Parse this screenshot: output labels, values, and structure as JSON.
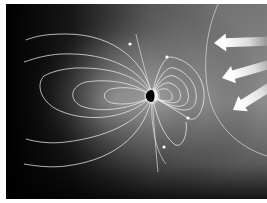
{
  "figure": {
    "title": "Earth's magnetosphere in the solar wind",
    "colors": {
      "background_dark": "#000000",
      "background_light": "#8a8a8a",
      "field_line": "#e6e6e6",
      "earth_day": "#f4f4f4",
      "earth_night": "#000000",
      "arrow": "#f2f2f2",
      "border": "#ffffff"
    },
    "elements": {
      "earth": {
        "label": "Earth",
        "cx": 146,
        "cy": 92,
        "r": 6
      },
      "bow_shock": {
        "label": "Bow shock"
      },
      "solar_wind_arrows": {
        "label": "Solar wind",
        "count": 3
      },
      "field_lines": {
        "label": "Magnetic field lines",
        "dayside_loops": 5,
        "nightside_loops": 5
      },
      "direction_markers": {
        "count": 4
      }
    }
  }
}
